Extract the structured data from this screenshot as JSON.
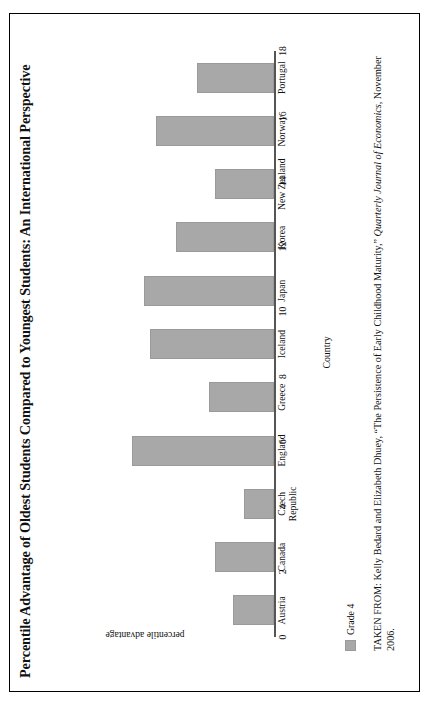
{
  "figure": {
    "title": "Percentile Advantage of Oldest Students Compared to Youngest Students: An International Perspective",
    "source_prefix": "TAKEN FROM: Kelly Bedard and Elizabeth Dhuey, “The Persistence of Early Childhood Maturity,” ",
    "source_italic": "Quarterly Journal of Economics",
    "source_suffix": ", November 2006.",
    "legend_label": "Grade 4",
    "bar_color": "#a8a8a8",
    "axis_color": "#555555"
  },
  "chart_data": {
    "type": "bar",
    "title": "Percentile Advantage of Oldest Students Compared to Youngest Students: An International Perspective",
    "xlabel": "Country",
    "ylabel": "percentile advantage",
    "ylim": [
      0,
      18
    ],
    "yticks": [
      "0",
      "2",
      "4",
      "6",
      "8",
      "10",
      "12",
      "14",
      "16",
      "18"
    ],
    "grid": false,
    "legend": [
      "Grade 4"
    ],
    "legend_position": "below-left",
    "categories": [
      "Austria",
      "Canada",
      "Czech Republic",
      "England",
      "Greece",
      "Iceland",
      "Japan",
      "Korea",
      "New Zealand",
      "Norway",
      "Portugal"
    ],
    "series": [
      {
        "name": "Grade 4",
        "values": [
          3.5,
          5.0,
          2.5,
          12.0,
          5.5,
          10.5,
          11.0,
          8.3,
          5.0,
          10.0,
          6.5
        ]
      }
    ]
  }
}
